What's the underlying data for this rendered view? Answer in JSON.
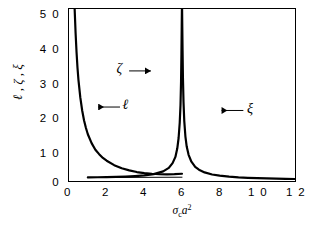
{
  "chart_data": {
    "type": "line",
    "title": "",
    "xlabel": "σₑa²",
    "ylabel": "ℓ , ζ , ξ",
    "xlim": [
      0,
      12
    ],
    "ylim": [
      0,
      50
    ],
    "xticks": [
      0,
      2,
      4,
      6,
      8,
      10,
      12
    ],
    "yticks": [
      0,
      10,
      20,
      30,
      40,
      50
    ],
    "xtick_labels": [
      "0",
      "2",
      "4",
      "6",
      "8",
      "1 0",
      "1 2"
    ],
    "ytick_labels": [
      "0",
      "1 0",
      "2 0",
      "3 0",
      "4 0",
      "5 0"
    ],
    "grid": false,
    "legend": "none",
    "frame": "box",
    "series": [
      {
        "name": "ℓ",
        "label": "ℓ",
        "description": "Decaying hyperbola entering the frame at the top near x=0.3 (y=50), falling steeply and flattening toward y~1 by x=4, then rising slightly and merging near x=6.",
        "x": [
          0.3,
          0.35,
          0.4,
          0.45,
          0.5,
          0.6,
          0.7,
          0.8,
          0.9,
          1.0,
          1.2,
          1.4,
          1.6,
          1.8,
          2.0,
          2.4,
          2.8,
          3.2,
          3.6,
          4.0,
          4.4,
          4.8,
          5.2,
          5.6,
          6.0
        ],
        "y": [
          50.0,
          43.0,
          37.5,
          33.0,
          29.5,
          24.3,
          20.5,
          17.6,
          15.4,
          13.6,
          11.0,
          9.1,
          7.8,
          6.7,
          5.9,
          4.6,
          3.7,
          3.1,
          2.6,
          2.3,
          2.1,
          2.0,
          1.95,
          2.0,
          2.1
        ]
      },
      {
        "name": "ζ",
        "label": "ζ",
        "description": "Left branch rising asymptotically to +infinity as x approaches 6 from below; low and flat (y~1-2) for x between 1 and 4.",
        "x": [
          1.0,
          1.5,
          2.0,
          2.5,
          3.0,
          3.5,
          4.0,
          4.5,
          5.0,
          5.3,
          5.5,
          5.65,
          5.75,
          5.82,
          5.88,
          5.92,
          5.95,
          5.97,
          5.985,
          5.995
        ],
        "y": [
          1.05,
          1.08,
          1.12,
          1.18,
          1.28,
          1.42,
          1.62,
          2.0,
          2.8,
          3.8,
          5.2,
          7.0,
          9.5,
          12.5,
          17.0,
          22.0,
          29.0,
          37.0,
          45.0,
          50.0
        ]
      },
      {
        "name": "ξ",
        "label": "ξ",
        "description": "Right branch descending from +infinity at x=6 toward ~0.4 at x=12.",
        "x": [
          6.005,
          6.015,
          6.03,
          6.05,
          6.08,
          6.12,
          6.18,
          6.25,
          6.35,
          6.5,
          6.7,
          6.9,
          7.2,
          7.6,
          8.0,
          8.5,
          9.0,
          9.5,
          10.0,
          10.5,
          11.0,
          11.5,
          12.0
        ],
        "y": [
          50.0,
          45.0,
          38.0,
          30.0,
          23.0,
          17.5,
          13.0,
          10.0,
          7.6,
          5.6,
          4.1,
          3.3,
          2.5,
          1.9,
          1.55,
          1.25,
          1.05,
          0.92,
          0.82,
          0.74,
          0.67,
          0.62,
          0.58
        ]
      },
      {
        "name": "baseline-segment",
        "label": "",
        "description": "Thin straight horizontal segment at y~1 drawn from x=1 to x=6.",
        "x": [
          1.0,
          6.0
        ],
        "y": [
          1.0,
          1.1
        ]
      }
    ],
    "annotations": [
      {
        "text": "ℓ",
        "arrow": "left",
        "x_data": 1.55,
        "y_data": 21.5
      },
      {
        "text": "ζ",
        "arrow": "right",
        "x_data": 4.35,
        "y_data": 32.0
      },
      {
        "text": "ξ",
        "arrow": "left",
        "x_data": 8.1,
        "y_data": 20.5
      }
    ],
    "colors": {
      "curve": "#000000",
      "axis": "#000000",
      "background": "#ffffff",
      "text": "#000000"
    }
  }
}
